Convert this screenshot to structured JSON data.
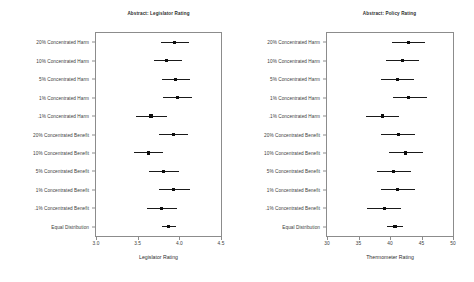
{
  "figure": {
    "background": "#ffffff",
    "point_color": "#0d0d0d",
    "line_color": "#1a1a1a",
    "frame_color": "#8c8c8c"
  },
  "chart_data": [
    {
      "type": "scatter",
      "title": "Abstract: Legislator Rating",
      "xlabel": "Legislator Rating",
      "ylabel": "",
      "xlim": [
        3.0,
        4.5
      ],
      "xticks": [
        3.0,
        3.5,
        4.0,
        4.5
      ],
      "xticklabels": [
        "3.0",
        "3.5",
        "4.0",
        "4.5"
      ],
      "grid": false,
      "legend": "none",
      "orientation": "horizontal-dotplot-with-error-bars",
      "categories": [
        "20% Concentrated Harm",
        "10% Concentrated Harm",
        "5% Concentrated Harm",
        "1% Concentrated Harm",
        ".1% Concentrated Harm",
        "20% Concentrated Benefit",
        "10% Concentrated Benefit",
        "5% Concentrated Benefit",
        "1% Concentrated Benefit",
        ".1% Concentrated Benefit",
        "Equal Distribution"
      ],
      "points": [
        {
          "category": "20% Concentrated Harm",
          "estimate": 3.94,
          "low": 3.78,
          "high": 4.12
        },
        {
          "category": "10% Concentrated Harm",
          "estimate": 3.85,
          "low": 3.69,
          "high": 4.03
        },
        {
          "category": "5% Concentrated Harm",
          "estimate": 3.95,
          "low": 3.79,
          "high": 4.13
        },
        {
          "category": "1% Concentrated Harm",
          "estimate": 3.98,
          "low": 3.8,
          "high": 4.15
        },
        {
          "category": ".1% Concentrated Harm",
          "estimate": 3.66,
          "low": 3.48,
          "high": 3.85
        },
        {
          "category": "20% Concentrated Benefit",
          "estimate": 3.93,
          "low": 3.76,
          "high": 4.1
        },
        {
          "category": "10% Concentrated Benefit",
          "estimate": 3.63,
          "low": 3.46,
          "high": 3.8
        },
        {
          "category": "5% Concentrated Benefit",
          "estimate": 3.81,
          "low": 3.63,
          "high": 4.0
        },
        {
          "category": "1% Concentrated Benefit",
          "estimate": 3.93,
          "low": 3.76,
          "high": 4.13
        },
        {
          "category": ".1% Concentrated Benefit",
          "estimate": 3.79,
          "low": 3.61,
          "high": 3.97
        },
        {
          "category": "Equal Distribution",
          "estimate": 3.87,
          "low": 3.79,
          "high": 3.96
        }
      ]
    },
    {
      "type": "scatter",
      "title": "Abstract: Policy Rating",
      "xlabel": "Thermometer Rating",
      "ylabel": "",
      "xlim": [
        30,
        50
      ],
      "xticks": [
        30,
        35,
        40,
        45,
        50
      ],
      "xticklabels": [
        "30",
        "35",
        "40",
        "45",
        "50"
      ],
      "grid": false,
      "legend": "none",
      "orientation": "horizontal-dotplot-with-error-bars",
      "categories": [
        "20% Concentrated Harm",
        "10% Concentrated Harm",
        "5% Concentrated Harm",
        "1% Concentrated Harm",
        ".1% Concentrated Harm",
        "20% Concentrated Benefit",
        "10% Concentrated Benefit",
        "5% Concentrated Benefit",
        "1% Concentrated Benefit",
        ".1% Concentrated Benefit",
        "Equal Distribution"
      ],
      "points": [
        {
          "category": "20% Concentrated Harm",
          "estimate": 42.9,
          "low": 40.3,
          "high": 45.6
        },
        {
          "category": "10% Concentrated Harm",
          "estimate": 42.0,
          "low": 39.4,
          "high": 44.6
        },
        {
          "category": "5% Concentrated Harm",
          "estimate": 41.2,
          "low": 38.5,
          "high": 43.8
        },
        {
          "category": "1% Concentrated Harm",
          "estimate": 43.0,
          "low": 40.4,
          "high": 45.8
        },
        {
          "category": ".1% Concentrated Harm",
          "estimate": 38.8,
          "low": 36.2,
          "high": 41.4
        },
        {
          "category": "20% Concentrated Benefit",
          "estimate": 41.3,
          "low": 38.6,
          "high": 44.0
        },
        {
          "category": "10% Concentrated Benefit",
          "estimate": 42.5,
          "low": 39.8,
          "high": 45.2
        },
        {
          "category": "5% Concentrated Benefit",
          "estimate": 40.6,
          "low": 38.0,
          "high": 43.3
        },
        {
          "category": "1% Concentrated Benefit",
          "estimate": 41.2,
          "low": 38.5,
          "high": 43.9
        },
        {
          "category": ".1% Concentrated Benefit",
          "estimate": 39.1,
          "low": 36.4,
          "high": 41.8
        },
        {
          "category": "Equal Distribution",
          "estimate": 40.8,
          "low": 39.6,
          "high": 42.1
        }
      ]
    }
  ]
}
